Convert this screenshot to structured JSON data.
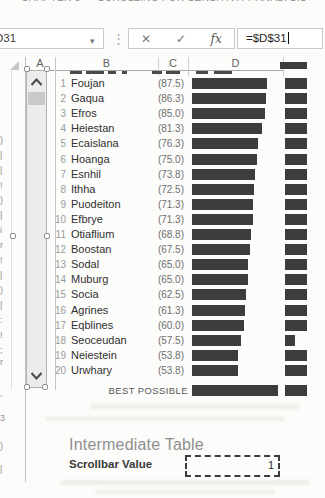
{
  "colors": {
    "bar_fill": "#3d3d3d",
    "grid_line": "#cfcfcf",
    "accent_text": "#8f8f8f"
  },
  "title_fragment": {
    "text": "CHAPTER 3 — SCROLLING FOR SENSITIVITY ANALYSIS"
  },
  "formula_bar": {
    "name_box": "D31",
    "dropdown_icon": "▾",
    "dots": "⋮",
    "cancel_label": "✕",
    "enter_label": "✓",
    "fx_label": "fx",
    "formula": "=$D$31"
  },
  "grid": {
    "column_headers": [
      "A",
      "B",
      "C",
      "D"
    ]
  },
  "table": {
    "bar_px_per_unit": 0.86,
    "rows": [
      {
        "rank": 1,
        "name": "Foujan",
        "value": "(87.5)",
        "score": 87.5,
        "e_bar_px": 22
      },
      {
        "rank": 2,
        "name": "Gaqua",
        "value": "(86.3)",
        "score": 86.3,
        "e_bar_px": 22
      },
      {
        "rank": 3,
        "name": "Efros",
        "value": "(85.0)",
        "score": 85.0,
        "e_bar_px": 22
      },
      {
        "rank": 4,
        "name": "Heiestan",
        "value": "(81.3)",
        "score": 81.3,
        "e_bar_px": 22
      },
      {
        "rank": 5,
        "name": "Ecaislana",
        "value": "(76.3)",
        "score": 76.3,
        "e_bar_px": 22
      },
      {
        "rank": 6,
        "name": "Hoanga",
        "value": "(75.0)",
        "score": 75.0,
        "e_bar_px": 22
      },
      {
        "rank": 7,
        "name": "Esnhil",
        "value": "(73.8)",
        "score": 73.8,
        "e_bar_px": 22
      },
      {
        "rank": 8,
        "name": "Ithha",
        "value": "(72.5)",
        "score": 72.5,
        "e_bar_px": 22
      },
      {
        "rank": 9,
        "name": "Puodeiton",
        "value": "(71.3)",
        "score": 71.3,
        "e_bar_px": 22
      },
      {
        "rank": 10,
        "name": "Efbrye",
        "value": "(71.3)",
        "score": 71.3,
        "e_bar_px": 22
      },
      {
        "rank": 11,
        "name": "Otiaflium",
        "value": "(68.8)",
        "score": 68.8,
        "e_bar_px": 22
      },
      {
        "rank": 12,
        "name": "Boostan",
        "value": "(67.5)",
        "score": 67.5,
        "e_bar_px": 22
      },
      {
        "rank": 13,
        "name": "Sodal",
        "value": "(65.0)",
        "score": 65.0,
        "e_bar_px": 22
      },
      {
        "rank": 14,
        "name": "Muburg",
        "value": "(65.0)",
        "score": 65.0,
        "e_bar_px": 22
      },
      {
        "rank": 15,
        "name": "Socia",
        "value": "(62.5)",
        "score": 62.5,
        "e_bar_px": 22
      },
      {
        "rank": 16,
        "name": "Agrines",
        "value": "(61.3)",
        "score": 61.3,
        "e_bar_px": 22
      },
      {
        "rank": 17,
        "name": "Eqblines",
        "value": "(60.0)",
        "score": 60.0,
        "e_bar_px": 22
      },
      {
        "rank": 18,
        "name": "Seoceudan",
        "value": "(57.5)",
        "score": 57.5,
        "e_bar_px": 10
      },
      {
        "rank": 19,
        "name": "Neiestein",
        "value": "(53.8)",
        "score": 53.8,
        "e_bar_px": 22
      },
      {
        "rank": 20,
        "name": "Urwhary",
        "value": "(53.8)",
        "score": 53.8,
        "e_bar_px": 22
      }
    ],
    "best_possible": {
      "label": "BEST POSSIBLE",
      "score": 100,
      "e_bar_px": 22
    }
  },
  "footer": {
    "section_title": "Intermediate Table",
    "field_label": "Scrollbar Value",
    "field_value": "1"
  },
  "left_edge_fragments": [
    {
      "y": 136,
      "glyph": ")"
    },
    {
      "y": 151,
      "glyph": "|"
    },
    {
      "y": 166,
      "glyph": "|"
    },
    {
      "y": 181,
      "glyph": "!"
    },
    {
      "y": 196,
      "glyph": ")"
    },
    {
      "y": 211,
      "glyph": "|"
    },
    {
      "y": 226,
      "glyph": "i"
    },
    {
      "y": 241,
      "glyph": "r"
    },
    {
      "y": 256,
      "glyph": "!"
    },
    {
      "y": 271,
      "glyph": "|"
    },
    {
      "y": 286,
      "glyph": ")"
    },
    {
      "y": 301,
      "glyph": "|"
    },
    {
      "y": 316,
      "glyph": ":"
    },
    {
      "y": 331,
      "glyph": "!"
    },
    {
      "y": 346,
      "glyph": ";"
    },
    {
      "y": 358,
      "glyph": "r"
    },
    {
      "y": 389,
      "glyph": ","
    },
    {
      "y": 414,
      "glyph": "3"
    },
    {
      "y": 442,
      "glyph": ")"
    },
    {
      "y": 465,
      "glyph": "|"
    }
  ]
}
